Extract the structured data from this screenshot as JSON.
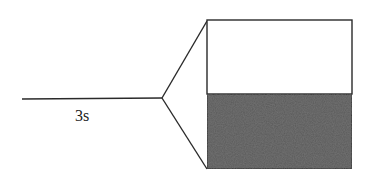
{
  "diagram": {
    "stem_label": "3s",
    "colors": {
      "line": "#2a2a2a",
      "upper_fill": "#ffffff",
      "lower_fill": "#555555",
      "background": "#ffffff"
    },
    "geometry": {
      "stem": {
        "x1": 22,
        "y1": 99,
        "x2": 162,
        "y2": 98
      },
      "apex": {
        "x": 162,
        "y": 98
      },
      "box": {
        "x": 207,
        "y": 20,
        "width": 145,
        "height": 150,
        "divider_y": 94
      }
    }
  }
}
